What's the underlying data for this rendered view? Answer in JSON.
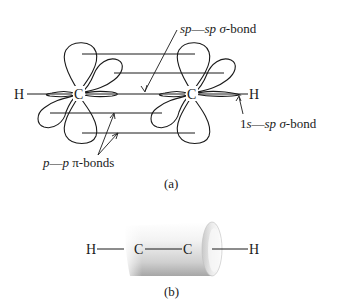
{
  "figure_a": {
    "caption": "(a)",
    "atoms": {
      "left_h": "H",
      "left_c": "C",
      "right_c": "C",
      "right_h": "H"
    },
    "labels": {
      "sp_sp_sigma": {
        "part1": "sp",
        "dash": "—",
        "part2": "sp",
        "sigma": "σ",
        "suffix": "-bond"
      },
      "s_sp_sigma": {
        "part1": "1",
        "part1b": "s",
        "dash": "—",
        "part2": "sp",
        "sigma": "σ",
        "suffix": "-bond"
      },
      "p_p_pi": {
        "part1": "p",
        "dash": "—",
        "part2": "p",
        "pi": "π",
        "suffix": "-bonds"
      }
    }
  },
  "figure_b": {
    "caption": "(b)",
    "atoms": {
      "left_h": "H",
      "left_c": "C",
      "right_c": "C",
      "right_h": "H"
    }
  },
  "colors": {
    "line": "#1a1a1a",
    "cylinder_light": "#f4f4f4",
    "cylinder_dark": "#a8a8a8"
  }
}
